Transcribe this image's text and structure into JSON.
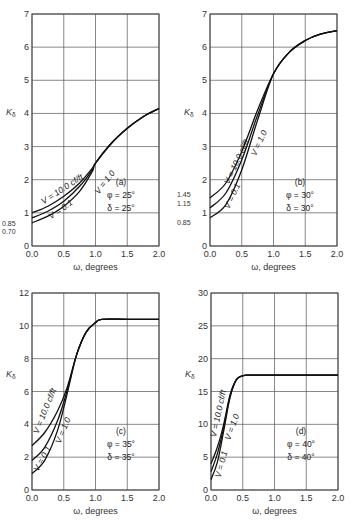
{
  "chart_data": [
    {
      "type": "line",
      "panel": "(a)",
      "annotation": [
        "(a)",
        "φ = 25°",
        "δ = 25°"
      ],
      "xlabel": "ω, degrees",
      "ylabel": "Kδ",
      "xlim": [
        0.0,
        2.0
      ],
      "ylim": [
        0,
        7
      ],
      "x_ticks": [
        "0.0",
        "0.5",
        "1.0",
        "1.5",
        "2.0"
      ],
      "y_ticks": [
        "0",
        "1",
        "2",
        "3",
        "4",
        "5",
        "6",
        "7"
      ],
      "grid": true,
      "intercept_labels": [
        "0.85",
        "0.70"
      ],
      "series": [
        {
          "name": "V = 10.0 cf/ft",
          "x": [
            0.0,
            0.25,
            0.5,
            0.75,
            0.95,
            1.0,
            1.25,
            1.5,
            1.75,
            2.0
          ],
          "y": [
            1.0,
            1.2,
            1.5,
            1.9,
            2.35,
            2.5,
            3.1,
            3.55,
            3.9,
            4.15
          ]
        },
        {
          "name": "V = 1.0",
          "x": [
            0.0,
            0.25,
            0.5,
            0.75,
            0.95,
            1.0,
            1.25,
            1.5,
            1.75,
            2.0
          ],
          "y": [
            0.85,
            1.05,
            1.35,
            1.8,
            2.3,
            2.5,
            3.1,
            3.55,
            3.9,
            4.15
          ]
        },
        {
          "name": "V = 0.1",
          "x": [
            0.0,
            0.25,
            0.5,
            0.75,
            0.95,
            1.0,
            1.25,
            1.5,
            1.75,
            2.0
          ],
          "y": [
            0.7,
            0.9,
            1.2,
            1.65,
            2.25,
            2.5,
            3.1,
            3.55,
            3.9,
            4.15
          ]
        }
      ]
    },
    {
      "type": "line",
      "panel": "(b)",
      "annotation": [
        "(b)",
        "φ = 30°",
        "δ = 30°"
      ],
      "xlabel": "ω, degrees",
      "ylabel": "Kδ",
      "xlim": [
        0.0,
        2.0
      ],
      "ylim": [
        0,
        7
      ],
      "x_ticks": [
        "0.0",
        "0.5",
        "1.0",
        "1.5",
        "2.0"
      ],
      "y_ticks": [
        "0",
        "1",
        "2",
        "3",
        "4",
        "5",
        "6",
        "7"
      ],
      "grid": true,
      "intercept_labels": [
        "1.45",
        "1.15",
        "0.85"
      ],
      "series": [
        {
          "name": "V = 10.0 cf/ft",
          "x": [
            0.0,
            0.25,
            0.5,
            0.75,
            1.0,
            1.25,
            1.5,
            1.75,
            2.0
          ],
          "y": [
            1.45,
            1.9,
            2.85,
            4.1,
            5.2,
            5.85,
            6.2,
            6.4,
            6.5
          ]
        },
        {
          "name": "V = 1.0",
          "x": [
            0.0,
            0.25,
            0.5,
            0.75,
            1.0,
            1.25,
            1.5,
            1.75,
            2.0
          ],
          "y": [
            1.15,
            1.6,
            2.6,
            3.95,
            5.2,
            5.85,
            6.2,
            6.4,
            6.5
          ]
        },
        {
          "name": "V = 0.1",
          "x": [
            0.0,
            0.25,
            0.5,
            0.75,
            1.0,
            1.25,
            1.5,
            1.75,
            2.0
          ],
          "y": [
            0.85,
            1.25,
            2.3,
            3.8,
            5.2,
            5.85,
            6.2,
            6.4,
            6.5
          ]
        }
      ]
    },
    {
      "type": "line",
      "panel": "(c)",
      "annotation": [
        "(c)",
        "φ = 35°",
        "δ = 35°"
      ],
      "xlabel": "ω, degrees",
      "ylabel": "Kδ",
      "xlim": [
        0.0,
        2.0
      ],
      "ylim": [
        0,
        12
      ],
      "x_ticks": [
        "0.0",
        "0.5",
        "1.0",
        "1.5",
        "2.0"
      ],
      "y_ticks": [
        "0",
        "2",
        "4",
        "6",
        "8",
        "10",
        "12"
      ],
      "grid": true,
      "series": [
        {
          "name": "V = 10.0 cf/ft",
          "x": [
            0.0,
            0.2,
            0.4,
            0.55,
            0.7,
            0.85,
            1.0,
            1.1,
            1.5,
            2.0
          ],
          "y": [
            2.7,
            3.5,
            4.8,
            6.2,
            8.2,
            9.6,
            10.2,
            10.4,
            10.4,
            10.4
          ]
        },
        {
          "name": "V = 1.0",
          "x": [
            0.0,
            0.2,
            0.4,
            0.55,
            0.7,
            0.85,
            1.0,
            1.1,
            1.5,
            2.0
          ],
          "y": [
            1.8,
            2.6,
            4.2,
            6.0,
            8.2,
            9.6,
            10.2,
            10.4,
            10.4,
            10.4
          ]
        },
        {
          "name": "V = 0.1",
          "x": [
            0.0,
            0.2,
            0.4,
            0.55,
            0.7,
            0.85,
            1.0,
            1.1,
            1.5,
            2.0
          ],
          "y": [
            1.0,
            1.8,
            3.6,
            5.8,
            8.2,
            9.6,
            10.2,
            10.4,
            10.4,
            10.4
          ]
        }
      ]
    },
    {
      "type": "line",
      "panel": "(d)",
      "annotation": [
        "(d)",
        "φ = 40°",
        "δ = 40°"
      ],
      "xlabel": "ω, degrees",
      "ylabel": "Kδ",
      "xlim": [
        0.0,
        2.0
      ],
      "ylim": [
        0,
        30
      ],
      "x_ticks": [
        "0.0",
        "0.5",
        "1.0",
        "1.5",
        "2.0"
      ],
      "y_ticks": [
        "0",
        "5",
        "10",
        "15",
        "20",
        "25",
        "30"
      ],
      "grid": true,
      "series": [
        {
          "name": "V = 10.0 cf/ft",
          "x": [
            0.0,
            0.1,
            0.2,
            0.3,
            0.4,
            0.5,
            0.6,
            1.0,
            2.0
          ],
          "y": [
            4.0,
            6.5,
            10.0,
            14.5,
            16.8,
            17.4,
            17.5,
            17.5,
            17.5
          ]
        },
        {
          "name": "V = 1.0",
          "x": [
            0.0,
            0.1,
            0.2,
            0.3,
            0.4,
            0.5,
            0.6,
            1.0,
            2.0
          ],
          "y": [
            2.8,
            5.5,
            9.5,
            14.3,
            16.8,
            17.4,
            17.5,
            17.5,
            17.5
          ]
        },
        {
          "name": "V = 0.1",
          "x": [
            0.0,
            0.1,
            0.2,
            0.3,
            0.4,
            0.5,
            0.6,
            1.0,
            2.0
          ],
          "y": [
            1.6,
            4.2,
            9.0,
            14.1,
            16.8,
            17.4,
            17.5,
            17.5,
            17.5
          ]
        }
      ]
    }
  ],
  "labels": {
    "xlabel": "ω, degrees",
    "ylabel": "K",
    "ylabel_sub": "δ",
    "curve_v10": "V = 10.0 cf/ft",
    "curve_v1": "V = 1.0",
    "curve_v01": "V = 0.1",
    "a": {
      "panel": "(a)",
      "phi": "φ = 25°",
      "delta": "δ = 25°",
      "i1": "0.85",
      "i2": "0.70"
    },
    "b": {
      "panel": "(b)",
      "phi": "φ = 30°",
      "delta": "δ = 30°",
      "i1": "1.45",
      "i2": "1.15",
      "i3": "0.85"
    },
    "c": {
      "panel": "(c)",
      "phi": "φ = 35°",
      "delta": "δ = 35°"
    },
    "d": {
      "panel": "(d)",
      "phi": "φ = 40°",
      "delta": "δ = 40°"
    }
  }
}
